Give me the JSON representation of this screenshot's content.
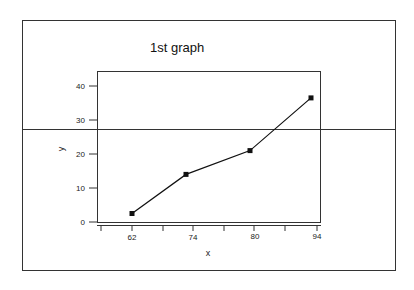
{
  "chart_data": {
    "type": "line",
    "title": "1st graph",
    "xlabel": "x",
    "ylabel": "y",
    "x_tick_labels": [
      "62",
      "74",
      "80",
      "94"
    ],
    "y_tick_labels": [
      "0",
      "10",
      "20",
      "30",
      "40"
    ],
    "ylim": [
      0,
      44
    ],
    "grid": false,
    "legend": null,
    "series": [
      {
        "name": "y",
        "x": [
          "62",
          "74",
          "80",
          "94"
        ],
        "values": [
          2.5,
          14,
          21,
          36.5
        ],
        "marker": "square",
        "color": "#111111"
      }
    ]
  },
  "colors": {
    "line": "#111111",
    "frame": "#333333",
    "background": "#ffffff"
  }
}
